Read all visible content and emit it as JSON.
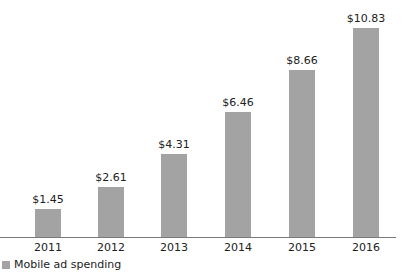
{
  "chart_data": {
    "type": "bar",
    "title": "",
    "xlabel": "",
    "ylabel": "",
    "categories": [
      "2011",
      "2012",
      "2013",
      "2014",
      "2015",
      "2016"
    ],
    "series": [
      {
        "name": "Mobile ad spending",
        "values": [
          1.45,
          2.61,
          4.31,
          6.46,
          8.66,
          10.83
        ],
        "labels": [
          "$1.45",
          "$2.61",
          "$4.31",
          "$6.46",
          "$8.66",
          "$10.83"
        ],
        "color": "#a3a3a3"
      }
    ],
    "ylim": [
      0,
      10.83
    ],
    "grid": false,
    "legend_position": "bottom-left",
    "data_labels": true
  },
  "legend": {
    "label": "Mobile ad spending"
  },
  "colors": {
    "bar": "#a3a3a3",
    "axis": "#7a7a7a"
  }
}
